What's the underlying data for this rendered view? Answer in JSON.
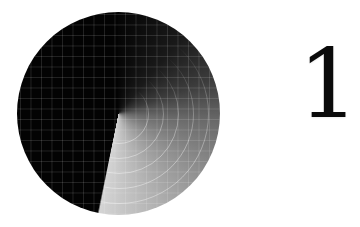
{
  "countdown": {
    "digit": "1",
    "digit_color": "#0a0a0a"
  },
  "dial": {
    "sweep_angle_deg": 192,
    "colors": {
      "dark": "#030303",
      "mid": "#6a6a6a",
      "light": "#d4d4d4",
      "background": "#ffffff"
    },
    "grid_spacing_px": 10.5,
    "ring_diameters_px": [
      60,
      90,
      120,
      150,
      180
    ]
  }
}
